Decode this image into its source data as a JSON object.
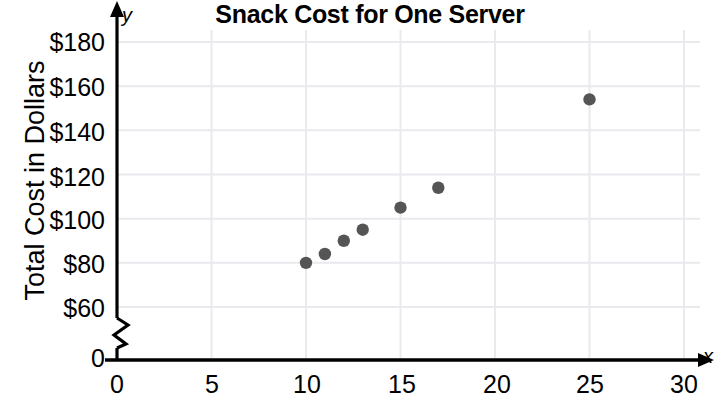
{
  "chart_data": {
    "type": "scatter",
    "title": "Snack Cost for One Server",
    "xlabel": "",
    "ylabel": "Total Cost in Dollars",
    "x": [
      10,
      11,
      12,
      13,
      15,
      17,
      25
    ],
    "values": [
      80,
      84,
      90,
      95,
      105,
      114,
      154
    ],
    "points": [
      {
        "x": 10,
        "y": 80
      },
      {
        "x": 11,
        "y": 84
      },
      {
        "x": 12,
        "y": 90
      },
      {
        "x": 13,
        "y": 95
      },
      {
        "x": 15,
        "y": 105
      },
      {
        "x": 17,
        "y": 114
      },
      {
        "x": 25,
        "y": 154
      }
    ],
    "xlim": [
      0,
      30
    ],
    "ylim": [
      60,
      180
    ],
    "x_ticks": [
      0,
      5,
      10,
      15,
      20,
      25,
      30
    ],
    "x_tick_labels": [
      "0",
      "5",
      "10",
      "15",
      "20",
      "25",
      "30"
    ],
    "y_ticks": [
      60,
      80,
      100,
      120,
      140,
      160,
      180
    ],
    "y_tick_labels": [
      "$60",
      "$80",
      "$100",
      "$120",
      "$140",
      "$160",
      "$180"
    ],
    "y_origin_label": "0",
    "y_axis_break": true,
    "grid": true,
    "legend": null,
    "x_axis_letter": "x",
    "y_axis_letter": "y",
    "colors": {
      "point": "#555555",
      "axis": "#000000",
      "grid": "#e9e9ee",
      "background": "#ffffff"
    }
  }
}
